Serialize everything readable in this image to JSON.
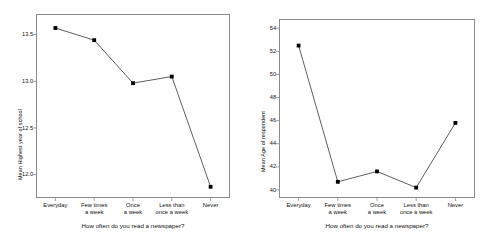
{
  "chart_data": [
    {
      "id": "left",
      "type": "line",
      "title": "",
      "xlabel": "How often do you read a newspaper?",
      "ylabel": "Mean Highest year of school",
      "categories": [
        "Everyday",
        "Few times a week",
        "Once a week",
        "Less than once a week",
        "Never"
      ],
      "categories_wrapped": [
        [
          "Everyday"
        ],
        [
          "Few times",
          "a week"
        ],
        [
          "Once",
          "a week"
        ],
        [
          "Less than",
          "once a week"
        ],
        [
          "Never"
        ]
      ],
      "values": [
        13.57,
        13.44,
        12.98,
        13.05,
        11.87
      ],
      "ylim": [
        11.75,
        13.72
      ],
      "yticks": [
        12.0,
        12.5,
        13.0,
        13.5
      ],
      "ytick_labels": [
        "12.0",
        "12.5",
        "13.0",
        "13.5"
      ],
      "grid": false,
      "legend": "none",
      "marker": "filled-square",
      "line_color": "#4d4d4d",
      "marker_color": "#000000"
    },
    {
      "id": "right",
      "type": "line",
      "title": "",
      "xlabel": "How often do you read a newspaper?",
      "ylabel": "Mean Age of respondent",
      "categories": [
        "Everyday",
        "Few times a week",
        "Once a week",
        "Less than once a week",
        "Never"
      ],
      "categories_wrapped": [
        [
          "Everyday"
        ],
        [
          "Few times",
          "a week"
        ],
        [
          "Once",
          "a week"
        ],
        [
          "Less than",
          "once a week"
        ],
        [
          "Never"
        ]
      ],
      "values": [
        52.5,
        40.7,
        41.6,
        40.2,
        45.8
      ],
      "ylim": [
        39.3,
        54.8
      ],
      "yticks": [
        40,
        42,
        44,
        46,
        48,
        50,
        52,
        54
      ],
      "ytick_labels": [
        "40",
        "42",
        "44",
        "46",
        "48",
        "50",
        "52",
        "54"
      ],
      "grid": false,
      "legend": "none",
      "marker": "filled-square",
      "line_color": "#4d4d4d",
      "marker_color": "#000000"
    }
  ]
}
